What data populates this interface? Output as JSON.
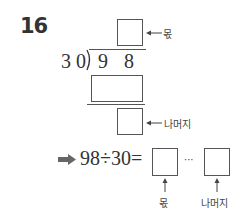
{
  "problem": {
    "number": "16",
    "divisor": "3 0",
    "dividend_d1": "9",
    "dividend_d2": "8",
    "quotient_label": "몫",
    "remainder_label": "나머지",
    "arrow_symbol": "➡",
    "equation_text": "98÷30=",
    "ellipsis": "···",
    "bottom_quotient_label": "몫",
    "bottom_remainder_label": "나머지"
  }
}
